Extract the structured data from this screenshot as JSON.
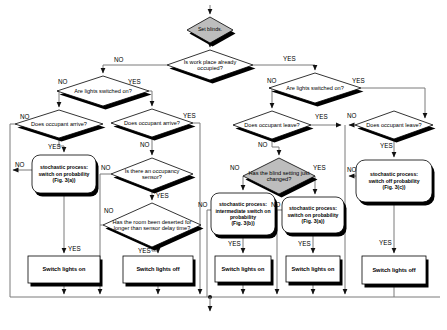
{
  "diagram": {
    "labels": {
      "yes": "YES",
      "no": "NO"
    },
    "colors": {
      "diamond_fill": "#ffffff",
      "shaded_fill": "#bdbdbd",
      "shadow": "#000000",
      "connector": "#7a7a7a"
    },
    "nodes": {
      "set_blinds": {
        "label": "Set blinds."
      },
      "workplace_occupied": {
        "label": "Is work place already occupied?"
      },
      "lights_on_left": {
        "label": "Are lights switched on?"
      },
      "occupant_arrive_1": {
        "label": "Does occupant arrive?"
      },
      "occupant_arrive_2": {
        "label": "Does occupant arrive?"
      },
      "occupancy_sensor": {
        "label": "Is there an occupancy sensor?"
      },
      "room_deserted": {
        "label": "Has the room been deserted for longer than sensor delay time?"
      },
      "lights_on_right": {
        "label": "Are lights switched on?"
      },
      "occupant_leave_1": {
        "label": "Does occupant leave?"
      },
      "occupant_leave_2": {
        "label": "Does occupant leave?"
      },
      "blind_setting_changed": {
        "label": "Has the blind setting just changed?"
      },
      "switch_on_prob_left": {
        "lines": [
          "stochastic process:",
          "switch on probability",
          "(Fig. 3(a))"
        ]
      },
      "intermediate_switch_on_prob": {
        "lines": [
          "stochastic process:",
          "intermediate switch on",
          "probability",
          "(Fig. 3(b))"
        ]
      },
      "switch_on_prob_right": {
        "lines": [
          "stochastic process:",
          "switch on probability",
          "(Fig. 3(a))"
        ]
      },
      "switch_off_prob": {
        "lines": [
          "stochastic process:",
          "switch off probability",
          "(Fig. 3(c))"
        ]
      },
      "switch_lights_on_1": {
        "label": "Switch lights on"
      },
      "switch_lights_off_1": {
        "label": "Switch lights off"
      },
      "switch_lights_on_2": {
        "label": "Switch lights on"
      },
      "switch_lights_on_3": {
        "label": "Switch lights on"
      },
      "switch_lights_off_2": {
        "label": "Switch lights off"
      }
    }
  }
}
